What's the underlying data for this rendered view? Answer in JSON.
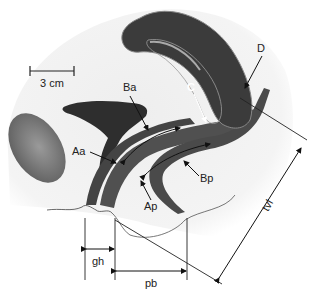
{
  "diagram": {
    "type": "anatomical-sagittal-section",
    "scale_bar": {
      "label": "3 cm"
    },
    "labels": {
      "Ba": "Ba",
      "C": "C",
      "D": "D",
      "Aa": "Aa",
      "Ap": "Ap",
      "Bp": "Bp",
      "gh": "gh",
      "pb": "pb",
      "tvl": "tvl"
    },
    "colors": {
      "organ_dark": "#3a3a3a",
      "organ_mid": "#555555",
      "bladder_light": "#777777",
      "body_fill": "#f2f2f2",
      "line": "#222222"
    }
  }
}
